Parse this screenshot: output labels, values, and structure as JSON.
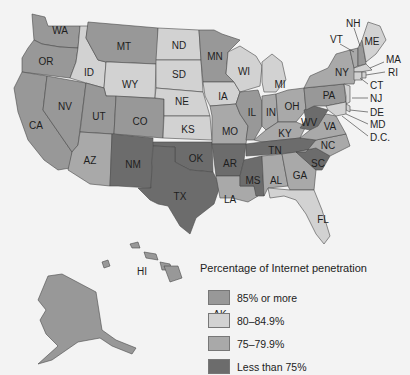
{
  "legend": {
    "title": "Percentage of Internet penetration",
    "items": [
      {
        "label": "85% or more",
        "color": "#989898"
      },
      {
        "label": "80–84.9%",
        "color": "#d2d2d2"
      },
      {
        "label": "75–79.9%",
        "color": "#a9a9a9"
      },
      {
        "label": "Less than 75%",
        "color": "#6c6c6c"
      }
    ]
  },
  "states": {
    "WA": "85% or more",
    "OR": "85% or more",
    "CA": "85% or more",
    "NV": "85% or more",
    "ID": "80–84.9%",
    "MT": "85% or more",
    "WY": "80–84.9%",
    "UT": "85% or more",
    "AZ": "75–79.9%",
    "CO": "85% or more",
    "NM": "Less than 75%",
    "ND": "80–84.9%",
    "SD": "80–84.9%",
    "NE": "80–84.9%",
    "KS": "80–84.9%",
    "OK": "Less than 75%",
    "TX": "Less than 75%",
    "MN": "85% or more",
    "IA": "80–84.9%",
    "MO": "75–79.9%",
    "AR": "Less than 75%",
    "LA": "75–79.9%",
    "WI": "80–84.9%",
    "IL": "85% or more",
    "MI": "80–84.9%",
    "IN": "75–79.9%",
    "OH": "75–79.9%",
    "KY": "75–79.9%",
    "TN": "Less than 75%",
    "MS": "Less than 75%",
    "AL": "75–79.9%",
    "GA": "75–79.9%",
    "FL": "80–84.9%",
    "SC": "Less than 75%",
    "NC": "75–79.9%",
    "VA": "75–79.9%",
    "WV": "Less than 75%",
    "PA": "85% or more",
    "NY": "75–79.9%",
    "VT": "75–79.9%",
    "NH": "85% or more",
    "ME": "80–84.9%",
    "MA": "80–84.9%",
    "RI": "80–84.9%",
    "CT": "80–84.9%",
    "NJ": "80–84.9%",
    "DE": "80–84.9%",
    "MD": "80–84.9%",
    "D.C.": "80–84.9%",
    "AK": "85% or more",
    "HI": "85% or more"
  },
  "labels": {
    "WA": "WA",
    "OR": "OR",
    "CA": "CA",
    "NV": "NV",
    "ID": "ID",
    "MT": "MT",
    "WY": "WY",
    "UT": "UT",
    "AZ": "AZ",
    "CO": "CO",
    "NM": "NM",
    "ND": "ND",
    "SD": "SD",
    "NE": "NE",
    "KS": "KS",
    "OK": "OK",
    "TX": "TX",
    "MN": "MN",
    "IA": "IA",
    "MO": "MO",
    "AR": "AR",
    "LA": "LA",
    "WI": "WI",
    "IL": "IL",
    "MI": "MI",
    "IN": "IN",
    "OH": "OH",
    "KY": "KY",
    "TN": "TN",
    "MS": "MS",
    "AL": "AL",
    "GA": "GA",
    "FL": "FL",
    "SC": "SC",
    "NC": "NC",
    "VA": "VA",
    "WV": "WV",
    "PA": "PA",
    "NY": "NY",
    "VT": "VT",
    "NH": "NH",
    "ME": "ME",
    "MA": "MA",
    "RI": "RI",
    "CT": "CT",
    "NJ": "NJ",
    "DE": "DE",
    "MD": "MD",
    "DC": "D.C.",
    "AK": "AK",
    "HI": "HI"
  }
}
